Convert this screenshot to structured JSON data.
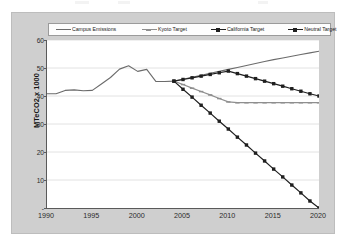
{
  "chart_data": {
    "type": "line",
    "title": "",
    "xlabel": "",
    "ylabel": "MTeCO2 x 1000",
    "xlim": [
      1990,
      2020
    ],
    "ylim": [
      0,
      60
    ],
    "grid": true,
    "legend_position": "top",
    "ytick_labels": [
      "60",
      "50",
      "40",
      "30",
      "20",
      "10",
      "-"
    ],
    "ytick_values": [
      60,
      50,
      40,
      30,
      20,
      10,
      0
    ],
    "xtick_labels": [
      "1990",
      "1995",
      "2000",
      "2005",
      "2010",
      "2015",
      "2020"
    ],
    "xtick_values": [
      1990,
      1995,
      2000,
      2005,
      2010,
      2015,
      2020
    ],
    "series": [
      {
        "name": "Campus Emissions",
        "color": "#6b6b6b",
        "marker": "none",
        "x": [
          1990,
          1991,
          1992,
          1993,
          1994,
          1995,
          1996,
          1997,
          1998,
          1999,
          2000,
          2001,
          2002,
          2003,
          2004,
          2005,
          2006,
          2007,
          2008,
          2009,
          2010,
          2011,
          2012,
          2013,
          2014,
          2015,
          2016,
          2017,
          2018,
          2019,
          2020
        ],
        "values": [
          40.8,
          40.8,
          42.0,
          42.2,
          41.9,
          42.0,
          44.3,
          46.6,
          49.6,
          50.8,
          48.8,
          49.5,
          45.2,
          45.2,
          45.3,
          46.0,
          46.7,
          47.4,
          48.1,
          48.8,
          49.5,
          50.2,
          50.9,
          51.6,
          52.3,
          53.0,
          53.6,
          54.2,
          54.8,
          55.4,
          56.0
        ]
      },
      {
        "name": "Kyoto Target",
        "color": "#8f8f8f",
        "marker": "dash",
        "x": [
          2004,
          2005,
          2006,
          2007,
          2008,
          2009,
          2010,
          2011,
          2012,
          2013,
          2014,
          2015,
          2016,
          2017,
          2018,
          2019,
          2020
        ],
        "values": [
          45.3,
          44.1,
          42.8,
          41.6,
          40.4,
          39.1,
          37.9,
          37.6,
          37.6,
          37.6,
          37.6,
          37.6,
          37.6,
          37.6,
          37.6,
          37.6,
          37.6
        ]
      },
      {
        "name": "California Target",
        "color": "#1f1f1f",
        "marker": "square",
        "x": [
          2004,
          2005,
          2006,
          2007,
          2008,
          2009,
          2010,
          2011,
          2012,
          2013,
          2014,
          2015,
          2016,
          2017,
          2018,
          2019,
          2020
        ],
        "values": [
          45.3,
          45.9,
          46.5,
          47.1,
          47.7,
          48.3,
          48.9,
          48.0,
          47.1,
          46.2,
          45.3,
          44.4,
          43.5,
          42.6,
          41.7,
          40.8,
          40.0
        ]
      },
      {
        "name": "Neutral Target",
        "color": "#1f1f1f",
        "marker": "square",
        "x": [
          2004,
          2005,
          2006,
          2007,
          2008,
          2009,
          2010,
          2011,
          2012,
          2013,
          2014,
          2015,
          2016,
          2017,
          2018,
          2019,
          2020
        ],
        "values": [
          45.3,
          42.4,
          39.6,
          36.7,
          33.9,
          31.0,
          28.2,
          25.3,
          22.5,
          19.6,
          16.8,
          13.9,
          11.1,
          8.2,
          5.4,
          2.5,
          0.0
        ]
      }
    ]
  },
  "legend": {
    "entries": [
      {
        "label": "Campus Emissions"
      },
      {
        "label": "Kyoto Target"
      },
      {
        "label": "California Target"
      },
      {
        "label": "Neutral Target"
      }
    ]
  },
  "axes": {
    "y_title": "MTeCO2 x 1000"
  },
  "colors": {
    "frame": "#cfcfcf",
    "plot_background": "#ffffff",
    "axis": "#5a5a5a",
    "gridline": "#e2e2e2",
    "campus": "#6b6b6b",
    "kyoto": "#8f8f8f",
    "california": "#1f1f1f",
    "neutral": "#1f1f1f"
  }
}
